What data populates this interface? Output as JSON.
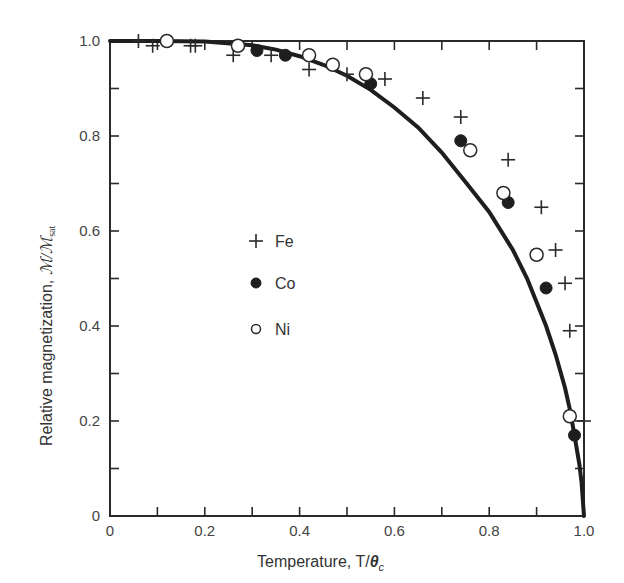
{
  "chart_data": {
    "type": "scatter",
    "title": "",
    "xlabel": "Temperature, T/θc",
    "xlabel_parts": {
      "main": "Temperature, T/",
      "symbol": "θ",
      "sub": "c"
    },
    "ylabel": "Relative magnetization, M/Msat",
    "ylabel_parts": {
      "main": "Relative magnetization, ",
      "symbol": "ℳ/ℳ",
      "sub": "sat"
    },
    "xlim": [
      0,
      1.0
    ],
    "ylim": [
      0,
      1.0
    ],
    "grid": false,
    "legend_position": "inside-center-left",
    "x_ticks": [
      0,
      0.1,
      0.2,
      0.3,
      0.4,
      0.5,
      0.6,
      0.7,
      0.8,
      0.9,
      1.0
    ],
    "x_tick_labels": [
      {
        "value": 0,
        "label": "0"
      },
      {
        "value": 0.2,
        "label": "0.2"
      },
      {
        "value": 0.4,
        "label": "0.4"
      },
      {
        "value": 0.6,
        "label": "0.6"
      },
      {
        "value": 0.8,
        "label": "0.8"
      },
      {
        "value": 1.0,
        "label": "1.0"
      }
    ],
    "y_ticks": [
      0,
      0.1,
      0.2,
      0.3,
      0.4,
      0.5,
      0.6,
      0.7,
      0.8,
      0.9,
      1.0
    ],
    "y_tick_labels": [
      {
        "value": 0,
        "label": "0"
      },
      {
        "value": 0.2,
        "label": "0.2"
      },
      {
        "value": 0.4,
        "label": "0.4"
      },
      {
        "value": 0.6,
        "label": "0.6"
      },
      {
        "value": 0.8,
        "label": "0.8"
      },
      {
        "value": 1.0,
        "label": "1.0"
      }
    ],
    "series": [
      {
        "name": "Fe",
        "marker": "plus",
        "points": [
          [
            0.06,
            1.0
          ],
          [
            0.09,
            0.99
          ],
          [
            0.17,
            0.99
          ],
          [
            0.18,
            0.99
          ],
          [
            0.26,
            0.97
          ],
          [
            0.34,
            0.97
          ],
          [
            0.42,
            0.94
          ],
          [
            0.5,
            0.93
          ],
          [
            0.58,
            0.92
          ],
          [
            0.66,
            0.88
          ],
          [
            0.74,
            0.84
          ],
          [
            0.84,
            0.75
          ],
          [
            0.91,
            0.65
          ],
          [
            0.94,
            0.56
          ],
          [
            0.96,
            0.49
          ],
          [
            0.97,
            0.39
          ],
          [
            1.0,
            0.2
          ]
        ]
      },
      {
        "name": "Co",
        "marker": "filled-circle",
        "points": [
          [
            0.31,
            0.98
          ],
          [
            0.37,
            0.97
          ],
          [
            0.55,
            0.91
          ],
          [
            0.74,
            0.79
          ],
          [
            0.84,
            0.66
          ],
          [
            0.92,
            0.48
          ],
          [
            0.98,
            0.17
          ]
        ]
      },
      {
        "name": "Ni",
        "marker": "open-circle",
        "points": [
          [
            0.12,
            1.0
          ],
          [
            0.27,
            0.99
          ],
          [
            0.42,
            0.97
          ],
          [
            0.47,
            0.95
          ],
          [
            0.54,
            0.93
          ],
          [
            0.76,
            0.77
          ],
          [
            0.83,
            0.68
          ],
          [
            0.9,
            0.55
          ],
          [
            0.97,
            0.21
          ]
        ]
      }
    ],
    "theory_curve": {
      "name": "Theoretical (mean-field) curve",
      "points": [
        [
          0.0,
          1.0
        ],
        [
          0.1,
          1.0
        ],
        [
          0.2,
          0.999
        ],
        [
          0.3,
          0.991
        ],
        [
          0.35,
          0.982
        ],
        [
          0.4,
          0.968
        ],
        [
          0.45,
          0.95
        ],
        [
          0.5,
          0.927
        ],
        [
          0.55,
          0.897
        ],
        [
          0.6,
          0.86
        ],
        [
          0.65,
          0.818
        ],
        [
          0.7,
          0.765
        ],
        [
          0.75,
          0.703
        ],
        [
          0.8,
          0.64
        ],
        [
          0.85,
          0.56
        ],
        [
          0.88,
          0.5
        ],
        [
          0.9,
          0.45
        ],
        [
          0.92,
          0.4
        ],
        [
          0.94,
          0.34
        ],
        [
          0.96,
          0.27
        ],
        [
          0.97,
          0.225
        ],
        [
          0.98,
          0.17
        ],
        [
          0.99,
          0.11
        ],
        [
          0.995,
          0.07
        ],
        [
          1.0,
          0.0
        ]
      ]
    },
    "legend": [
      {
        "label": "Fe",
        "marker": "plus"
      },
      {
        "label": "Co",
        "marker": "filled-circle"
      },
      {
        "label": "Ni",
        "marker": "open-circle"
      }
    ]
  }
}
